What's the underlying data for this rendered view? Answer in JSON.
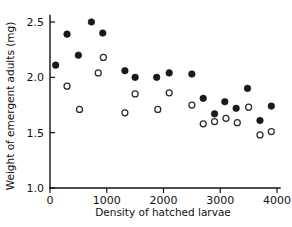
{
  "chart_data": {
    "type": "scatter",
    "title": "",
    "xlabel": "Density of hatched larvae",
    "ylabel": "Weight of emergent adults (mg)",
    "xlim": [
      0,
      4000
    ],
    "ylim": [
      1.0,
      2.6
    ],
    "grid": false,
    "legend": "none",
    "xticks": [
      0,
      1000,
      2000,
      3000,
      4000
    ],
    "xtick_labels": [
      "0",
      "1000",
      "2000",
      "3000",
      "4000"
    ],
    "yticks": [
      1.0,
      1.5,
      2.0,
      2.5
    ],
    "ytick_labels": [
      "1.0",
      "1.5",
      "2.0",
      "2.5"
    ],
    "series": [
      {
        "name": "filled-circles",
        "marker": "filled-circle",
        "color": "#1a1a1a",
        "points": [
          {
            "x": 100,
            "y": 2.11
          },
          {
            "x": 300,
            "y": 2.39
          },
          {
            "x": 500,
            "y": 2.2
          },
          {
            "x": 730,
            "y": 2.5
          },
          {
            "x": 930,
            "y": 2.4
          },
          {
            "x": 1320,
            "y": 2.06
          },
          {
            "x": 1500,
            "y": 2.0
          },
          {
            "x": 1880,
            "y": 2.0
          },
          {
            "x": 2100,
            "y": 2.04
          },
          {
            "x": 2500,
            "y": 2.03
          },
          {
            "x": 2700,
            "y": 1.81
          },
          {
            "x": 2900,
            "y": 1.67
          },
          {
            "x": 3080,
            "y": 1.78
          },
          {
            "x": 3280,
            "y": 1.72
          },
          {
            "x": 3480,
            "y": 1.9
          },
          {
            "x": 3700,
            "y": 1.61
          },
          {
            "x": 3900,
            "y": 1.74
          }
        ]
      },
      {
        "name": "open-circles",
        "marker": "open-circle",
        "color": "#2a2a2a",
        "points": [
          {
            "x": 300,
            "y": 1.92
          },
          {
            "x": 520,
            "y": 1.71
          },
          {
            "x": 850,
            "y": 2.04
          },
          {
            "x": 940,
            "y": 2.18
          },
          {
            "x": 1320,
            "y": 1.68
          },
          {
            "x": 1500,
            "y": 1.85
          },
          {
            "x": 1900,
            "y": 1.71
          },
          {
            "x": 2100,
            "y": 1.86
          },
          {
            "x": 2500,
            "y": 1.75
          },
          {
            "x": 2700,
            "y": 1.58
          },
          {
            "x": 2900,
            "y": 1.6
          },
          {
            "x": 3100,
            "y": 1.63
          },
          {
            "x": 3300,
            "y": 1.59
          },
          {
            "x": 3500,
            "y": 1.73
          },
          {
            "x": 3700,
            "y": 1.48
          },
          {
            "x": 3900,
            "y": 1.51
          }
        ]
      }
    ]
  }
}
